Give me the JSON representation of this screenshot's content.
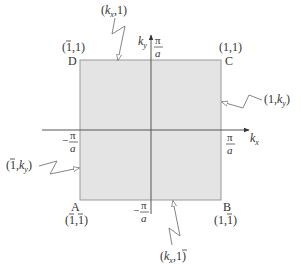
{
  "diagram": {
    "colors": {
      "zone_fill": "#e4e4e4",
      "zone_border": "#9a9a9a",
      "axis": "#555555",
      "text": "#333333",
      "pointer": "#777777"
    },
    "axes": {
      "x_label_main": "k",
      "x_label_sub": "x",
      "y_label_main": "k",
      "y_label_sub": "y",
      "pi": "π",
      "a": "a",
      "minus": "−"
    },
    "corners": {
      "D": {
        "letter": "D",
        "coord_open": "(",
        "coord_a": "1",
        "coord_a_bar": true,
        "coord_sep": ",",
        "coord_b": "1",
        "coord_b_bar": false,
        "coord_close": ")"
      },
      "C": {
        "letter": "C",
        "coord_open": "(",
        "coord_a": "1",
        "coord_a_bar": false,
        "coord_sep": ",",
        "coord_b": "1",
        "coord_b_bar": false,
        "coord_close": ")"
      },
      "A": {
        "letter": "A",
        "coord_open": "(",
        "coord_a": "1",
        "coord_a_bar": true,
        "coord_sep": ",",
        "coord_b": "1",
        "coord_b_bar": true,
        "coord_close": ")"
      },
      "B": {
        "letter": "B",
        "coord_open": "(",
        "coord_a": "1",
        "coord_a_bar": false,
        "coord_sep": ",",
        "coord_b": "1",
        "coord_b_bar": true,
        "coord_close": ")"
      }
    },
    "edges": {
      "top": {
        "open": "(",
        "k": "k",
        "sub": "x",
        "sep": ",",
        "val": "1",
        "close": ")"
      },
      "right": {
        "open": "(",
        "val": "1",
        "sep": ",",
        "k": "k",
        "sub": "y",
        "close": ")"
      },
      "left": {
        "open": "(",
        "val": "1",
        "sep": ",",
        "k": "k",
        "sub": "y",
        "close": ")"
      },
      "bottom": {
        "open": "(",
        "k": "k",
        "sub": "x",
        "sep": ",",
        "val": "1",
        "close": ")"
      }
    }
  }
}
